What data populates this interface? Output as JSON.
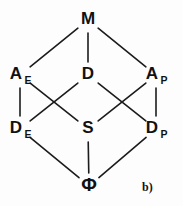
{
  "figure": {
    "caption": "b)",
    "type": "hasse-diagram",
    "background_color": "#fdfdfd",
    "edge_color": "#1c1c1c",
    "label_color": "#111111"
  },
  "nodes": [
    {
      "id": "M",
      "base": "M",
      "subscript": "",
      "x": 88,
      "y": 20,
      "level": 0
    },
    {
      "id": "AE",
      "base": "A",
      "subscript": "E",
      "x": 20,
      "y": 75,
      "level": 1
    },
    {
      "id": "D",
      "base": "D",
      "subscript": "",
      "x": 88,
      "y": 75,
      "level": 1
    },
    {
      "id": "AP",
      "base": "A",
      "subscript": "P",
      "x": 156,
      "y": 75,
      "level": 1
    },
    {
      "id": "DE",
      "base": "D",
      "subscript": "E",
      "x": 20,
      "y": 129,
      "level": 2
    },
    {
      "id": "S",
      "base": "S",
      "subscript": "",
      "x": 88,
      "y": 129,
      "level": 2
    },
    {
      "id": "DP",
      "base": "D",
      "subscript": "P",
      "x": 156,
      "y": 129,
      "level": 2
    },
    {
      "id": "PHI",
      "base": "Φ",
      "subscript": "",
      "x": 89,
      "y": 186,
      "level": 3
    }
  ],
  "edges": [
    {
      "from": "M",
      "to": "AE"
    },
    {
      "from": "M",
      "to": "D"
    },
    {
      "from": "M",
      "to": "AP"
    },
    {
      "from": "AE",
      "to": "DE"
    },
    {
      "from": "AE",
      "to": "S"
    },
    {
      "from": "D",
      "to": "DE"
    },
    {
      "from": "D",
      "to": "DP"
    },
    {
      "from": "AP",
      "to": "S"
    },
    {
      "from": "AP",
      "to": "DP"
    },
    {
      "from": "DE",
      "to": "PHI"
    },
    {
      "from": "S",
      "to": "PHI"
    },
    {
      "from": "DP",
      "to": "PHI"
    }
  ],
  "caption_position": {
    "x": 142,
    "y": 188
  }
}
